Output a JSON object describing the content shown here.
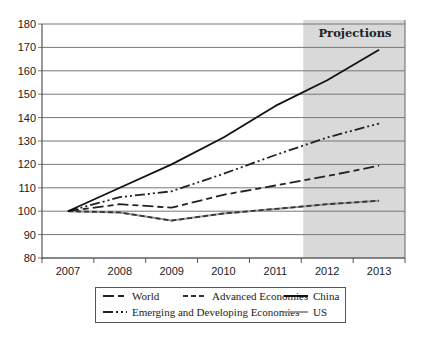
{
  "chart_data": {
    "type": "line",
    "title": "",
    "xlabel": "",
    "ylabel": "",
    "categories": [
      "2007",
      "2008",
      "2009",
      "2010",
      "2011",
      "2012",
      "2013"
    ],
    "ylim": [
      80,
      180
    ],
    "yticks": [
      80,
      90,
      100,
      110,
      120,
      130,
      140,
      150,
      160,
      170,
      180
    ],
    "grid": true,
    "shaded_region": {
      "label": "Projections",
      "from": "2012",
      "to": "2013",
      "color": "#d9d9d9"
    },
    "series": [
      {
        "name": "World",
        "style": "long-dash",
        "color": "#222222",
        "values": [
          100,
          103,
          101.5,
          107,
          111,
          115,
          119.5
        ]
      },
      {
        "name": "Advanced Economies",
        "style": "short-dash",
        "color": "#333333",
        "values": [
          100,
          99.5,
          96,
          99,
          101,
          103,
          104.5
        ]
      },
      {
        "name": "China",
        "style": "solid",
        "color": "#111111",
        "values": [
          100,
          110,
          120,
          131.5,
          145,
          156,
          169
        ]
      },
      {
        "name": "Emerging and Developing Economies",
        "style": "dash-dot-dot",
        "color": "#222222",
        "values": [
          100,
          106,
          108.5,
          116,
          124,
          131.5,
          137.5
        ]
      },
      {
        "name": "US",
        "style": "solid",
        "color": "#9a9a9a",
        "values": [
          100,
          99.5,
          96,
          99,
          101,
          103,
          104.5
        ]
      }
    ],
    "legend_position": "bottom"
  },
  "legend": {
    "items": [
      {
        "label": "World"
      },
      {
        "label": "Advanced Economies"
      },
      {
        "label": "China"
      },
      {
        "label": "Emerging and Developing Economies"
      },
      {
        "label": "US"
      }
    ]
  }
}
